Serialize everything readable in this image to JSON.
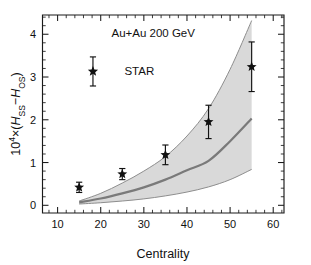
{
  "chart_data": {
    "type": "scatter",
    "title": "",
    "xlabel": "Centrality",
    "ylabel": "10⁴×(H_SS−H_OS)",
    "ylabel_parts": {
      "prefix": "10",
      "exponent": "4",
      "times": "×",
      "open": "(",
      "h1": "H",
      "sub1": "SS",
      "minus": "−",
      "h2": "H",
      "sub2": "OS",
      "close": ")"
    },
    "xlim": [
      6.5,
      62.5
    ],
    "ylim": [
      -0.18,
      4.45
    ],
    "xticks": [
      10,
      20,
      30,
      40,
      50,
      60
    ],
    "xticklabels": [
      "10",
      "20",
      "30",
      "40",
      "50",
      "60"
    ],
    "yticks": [
      0,
      1,
      2,
      3,
      4
    ],
    "yticklabels": [
      "0",
      "1",
      "2",
      "3",
      "4"
    ],
    "grid": false,
    "legend_position": "upper-left",
    "annotations": [
      {
        "name": "system-energy",
        "text": "Au+Au  200 GeV",
        "x": 22.5,
        "y": 4.02
      },
      {
        "name": "star-legend",
        "text": "STAR",
        "x": 25.5,
        "y": 3.13
      }
    ],
    "legend_marker": {
      "name": "star-with-errorbar",
      "x": 18.2,
      "y": 3.13,
      "yerr": 0.34
    },
    "series": [
      {
        "name": "STAR",
        "marker": "star",
        "color": "#111111",
        "x": [
          15,
          25,
          35,
          45,
          55
        ],
        "values": [
          0.42,
          0.73,
          1.18,
          1.95,
          3.24
        ],
        "yerr": [
          0.12,
          0.13,
          0.23,
          0.39,
          0.58
        ]
      },
      {
        "name": "model-band-upper",
        "type": "line",
        "color": "#8e8e8e",
        "x": [
          15,
          20,
          25,
          30,
          35,
          40,
          45,
          50,
          55
        ],
        "values": [
          0.1,
          0.28,
          0.52,
          0.8,
          1.14,
          1.62,
          2.26,
          3.18,
          4.32
        ]
      },
      {
        "name": "model-band-central",
        "type": "line",
        "color": "#7a7a7a",
        "x": [
          15,
          20,
          25,
          30,
          35,
          40,
          45,
          50,
          55
        ],
        "values": [
          0.07,
          0.16,
          0.28,
          0.42,
          0.6,
          0.82,
          1.04,
          1.5,
          2.03
        ]
      },
      {
        "name": "model-band-lower",
        "type": "line",
        "color": "#8e8e8e",
        "x": [
          15,
          20,
          25,
          30,
          35,
          40,
          45,
          50,
          55
        ],
        "values": [
          0.03,
          0.06,
          0.1,
          0.15,
          0.22,
          0.31,
          0.43,
          0.6,
          0.84
        ]
      }
    ],
    "band": {
      "name": "model-uncertainty-band",
      "fill": "#d6d6d6",
      "x_start": 15,
      "x_end": 55
    }
  }
}
